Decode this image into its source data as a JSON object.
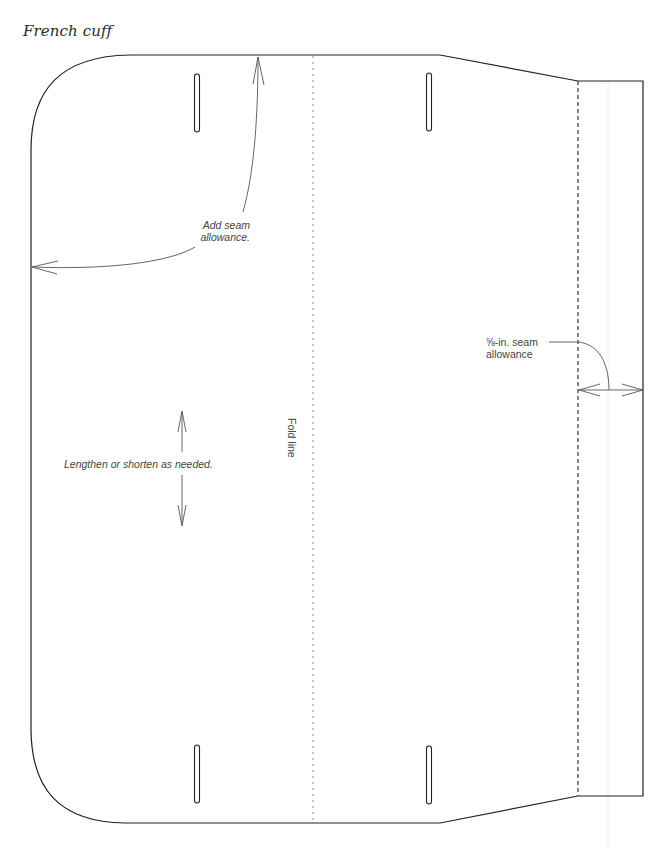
{
  "title": "French cuff",
  "labels": {
    "add_seam_line1": "Add seam",
    "add_seam_line2": "allowance.",
    "lengthen": "Lengthen or shorten as needed.",
    "fold_line": "Fold line",
    "seam_allowance_line1": "⅝-in. seam",
    "seam_allowance_line2": "allowance"
  },
  "colors": {
    "outline": "#222222",
    "annotation": "#555555",
    "fold_line": "#888888"
  },
  "markings": {
    "buttonholes": [
      {
        "position": "top-left"
      },
      {
        "position": "top-right"
      },
      {
        "position": "bottom-left"
      },
      {
        "position": "bottom-right"
      }
    ]
  }
}
